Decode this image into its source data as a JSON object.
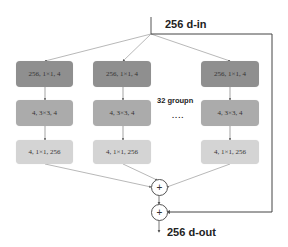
{
  "input_label": "256 d-in",
  "output_label": "256 d-out",
  "group_label": "32 groupn",
  "ellipsis": "....",
  "plus_symbol": "+",
  "branches": [
    {
      "layer1": "256, 1×1, 4",
      "layer2": "4, 3×3, 4",
      "layer3": "4, 1×1, 256"
    },
    {
      "layer1": "256, 1×1, 4",
      "layer2": "4, 3×3, 4",
      "layer3": "4, 1×1, 256"
    },
    {
      "layer1": "256, 1×1, 4",
      "layer2": "4, 3×3, 4",
      "layer3": "4, 1×1, 256"
    }
  ],
  "colors": {
    "layer1": "#8f8f8f",
    "layer2": "#ababab",
    "layer3": "#d4d4d4",
    "lines": "#555555"
  }
}
